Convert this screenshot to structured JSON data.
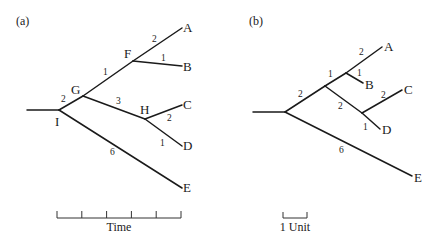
{
  "panels": [
    {
      "label": "(a)",
      "scale_label": "Time",
      "nodes": {
        "I": "I",
        "G": "G",
        "F": "F",
        "H": "H"
      },
      "tips": {
        "A": "A",
        "B": "B",
        "C": "C",
        "D": "D",
        "E": "E"
      },
      "branch_lengths": {
        "I_G": "2",
        "G_F": "1",
        "F_A": "2",
        "F_B": "1",
        "G_H": "3",
        "H_C": "2",
        "H_D": "1",
        "I_E": "6"
      }
    },
    {
      "label": "(b)",
      "scale_label": "1 Unit",
      "tips": {
        "A": "A",
        "B": "B",
        "C": "C",
        "D": "D",
        "E": "E"
      },
      "branch_lengths": {
        "root_AB_CD": "2",
        "to_AB": "1",
        "AB_A": "2",
        "AB_B": "1",
        "to_CD": "2",
        "CD_C": "2",
        "CD_D": "1",
        "root_E": "6"
      }
    }
  ]
}
